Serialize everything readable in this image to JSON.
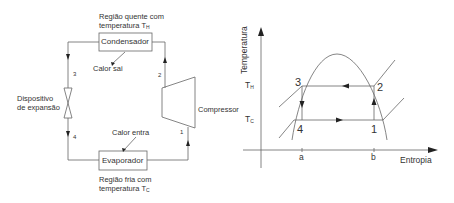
{
  "cycle_diagram": {
    "hot_region": {
      "line1": "Região quente com",
      "line2": "temperatura T",
      "sub": "H"
    },
    "condenser": "Condensador",
    "heat_out": "Calor sai",
    "expansion_device": {
      "line1": "Dispositivo",
      "line2": "de expansão"
    },
    "compressor": "Compressor",
    "heat_in": "Calor entra",
    "evaporator": "Evaporador",
    "cold_region": {
      "line1": "Região fria com",
      "line2": "temperatura T",
      "sub": "C"
    },
    "state_points": [
      "1",
      "2",
      "3",
      "4"
    ]
  },
  "ts_diagram": {
    "y_axis_label": "Temperatura",
    "x_axis_label": "Entropia",
    "t_hot": {
      "main": "T",
      "sub": "H"
    },
    "t_cold": {
      "main": "T",
      "sub": "C"
    },
    "x_ticks": [
      "a",
      "b"
    ],
    "points": {
      "p1": "1",
      "p2": "2",
      "p3": "3",
      "p4": "4"
    }
  },
  "colors": {
    "line": "#555555",
    "text": "#333333",
    "background": "#ffffff"
  }
}
